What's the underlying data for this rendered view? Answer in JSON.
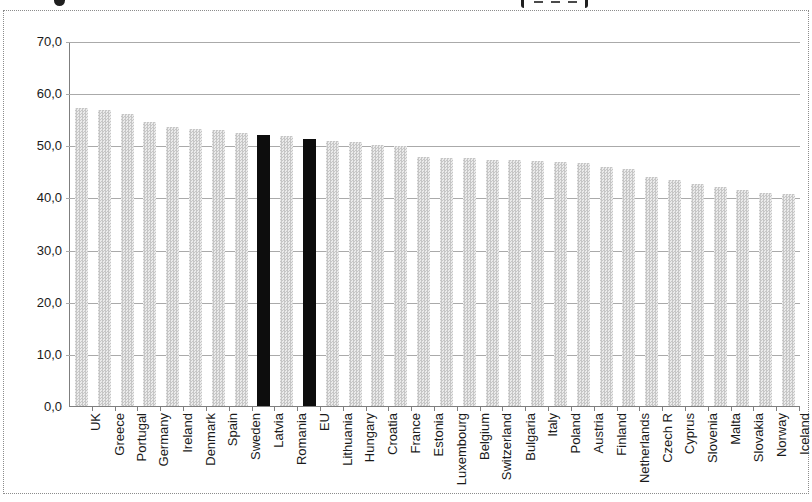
{
  "window": {
    "background_color": "#ffffff",
    "title_cropped_at_top": true
  },
  "chart_data": {
    "type": "bar",
    "categories": [
      "UK",
      "Greece",
      "Portugal",
      "Germany",
      "Ireland",
      "Denmark",
      "Spain",
      "Sweden",
      "Latvia",
      "Romania",
      "EU",
      "Lithuania",
      "Hungary",
      "Croatia",
      "France",
      "Estonia",
      "Luxembourg",
      "Belgium",
      "Switzerland",
      "Bulgaria",
      "Italy",
      "Poland",
      "Austria",
      "Finland",
      "Netherlands",
      "Czech R",
      "Cyprus",
      "Slovenia",
      "Malta",
      "Slovakia",
      "Norway",
      "Iceland"
    ],
    "values": [
      57.4,
      57.0,
      56.1,
      54.6,
      53.6,
      53.3,
      53.0,
      52.5,
      52.2,
      52.0,
      51.4,
      51.0,
      50.7,
      50.1,
      50.0,
      47.9,
      47.7,
      47.6,
      47.4,
      47.3,
      47.2,
      47.0,
      46.7,
      45.9,
      45.6,
      44.1,
      43.5,
      42.7,
      42.2,
      41.5,
      41.0,
      40.7
    ],
    "highlighted_categories": [
      "Latvia",
      "EU"
    ],
    "ylim": [
      0,
      70
    ],
    "ytick_step": 10,
    "ytick_labels_top_to_bottom": [
      "70,0",
      "60,0",
      "50,0",
      "40,0",
      "30,0",
      "20,0",
      "10,0",
      "0,0"
    ],
    "decimal_separator": ",",
    "grid": "horizontal",
    "legend": "none",
    "xlabel": "",
    "ylabel": "",
    "bar_pattern_dark_color": "#c6c6c6",
    "bar_pattern_light_color": "#ebebeb",
    "highlight_color": "#0d0d0d",
    "gridline_color": "#aaaaaa",
    "axis_color": "#7f7f7f",
    "frame_border_color": "#8c8c8c",
    "label_text_color": "#1a1a1a"
  }
}
